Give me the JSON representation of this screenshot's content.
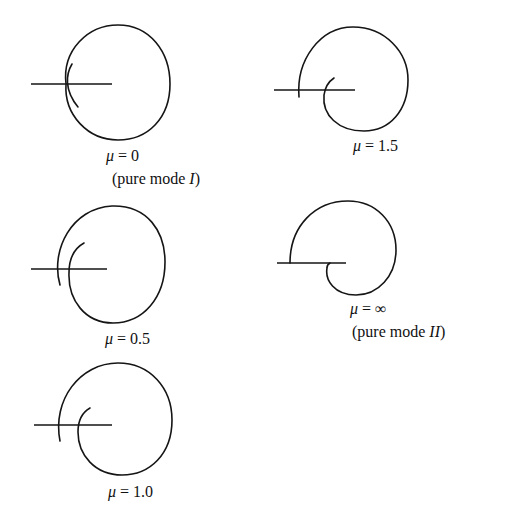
{
  "figure": {
    "type": "crack-tip plastic zone / trajectory shapes for varying mode mixity",
    "panels": [
      {
        "id": "mu-0",
        "symbol": "μ",
        "equals": " = ",
        "value": "0",
        "caption_prefix": "(pure mode ",
        "caption_mode": "I",
        "caption_suffix": ")"
      },
      {
        "id": "mu-1.5",
        "symbol": "μ",
        "equals": " = ",
        "value": "1.5"
      },
      {
        "id": "mu-0.5",
        "symbol": "μ",
        "equals": " = ",
        "value": "0.5"
      },
      {
        "id": "mu-infinity",
        "symbol": "μ",
        "equals": " = ",
        "value": "∞",
        "caption_prefix": "(pure mode ",
        "caption_mode": "II",
        "caption_suffix": ")"
      },
      {
        "id": "mu-1.0",
        "symbol": "μ",
        "equals": " = ",
        "value": "1.0"
      }
    ]
  }
}
